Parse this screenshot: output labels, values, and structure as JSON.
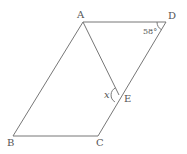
{
  "diagram": {
    "type": "geometry-parallelogram",
    "points": {
      "A": {
        "label": "A",
        "x": 83,
        "y": 22
      },
      "B": {
        "label": "B",
        "x": 13,
        "y": 136
      },
      "C": {
        "label": "C",
        "x": 98,
        "y": 136
      },
      "D": {
        "label": "D",
        "x": 166,
        "y": 22
      },
      "E": {
        "label": "E",
        "x": 119,
        "y": 95
      }
    },
    "segments": [
      "AB",
      "BC",
      "CD",
      "DA",
      "AE"
    ],
    "angles": {
      "angle_D": {
        "label": "58°",
        "vertex": "D"
      },
      "angle_E": {
        "label": "x",
        "vertex": "E"
      }
    },
    "colors": {
      "stroke": "#777777",
      "text": "#555555",
      "background": "#ffffff"
    }
  }
}
